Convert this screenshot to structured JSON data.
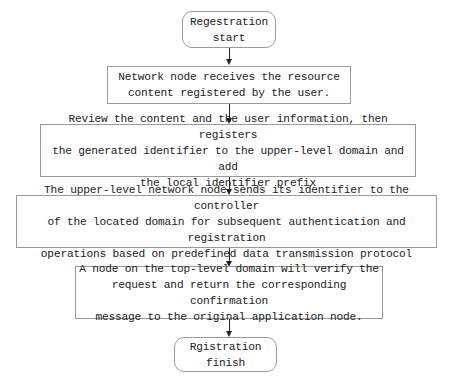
{
  "flowchart": {
    "start": {
      "label": "Regestration\nstart"
    },
    "steps": [
      {
        "label": "Network node receives the resource\ncontent registered by the user."
      },
      {
        "label": "Review the content and the user information, then registers\nthe generated identifier to the upper-level domain and add\nthe local identifier prefix"
      },
      {
        "label": "The upper-level network node sends its identifier to the controller\nof the located domain for subsequent authentication and registration\noperations based on predefined data transmission protocol"
      },
      {
        "label": "A node on the top-level domain will verify the\nrequest and return the corresponding confirmation\nmessage to the original application node."
      }
    ],
    "end": {
      "label": "Rgistration\nfinish"
    }
  }
}
